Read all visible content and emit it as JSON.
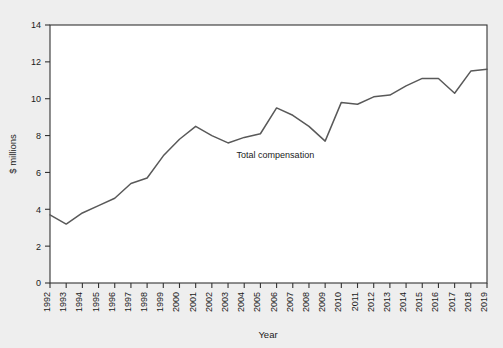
{
  "chart_data": {
    "type": "line",
    "title": "",
    "subtitle": "",
    "xlabel": "Year",
    "ylabel": "$ millions",
    "xlim": [
      1992,
      2019
    ],
    "ylim": [
      0,
      14
    ],
    "ytick_step": 2,
    "yticks": [
      "0",
      "2",
      "4",
      "6",
      "8",
      "10",
      "12",
      "14"
    ],
    "grid": false,
    "legend_position": "inline-annotation",
    "annotations": [
      {
        "text": "Total compensation",
        "x": 2006,
        "y": 6.8
      }
    ],
    "categories": [
      "1992",
      "1993",
      "1994",
      "1995",
      "1996",
      "1997",
      "1998",
      "1999",
      "2000",
      "2001",
      "2002",
      "2003",
      "2004",
      "2005",
      "2006",
      "2007",
      "2008",
      "2009",
      "2010",
      "2011",
      "2012",
      "2013",
      "2014",
      "2015",
      "2016",
      "2017",
      "2018",
      "2019"
    ],
    "series": [
      {
        "name": "Total compensation",
        "color": "#595959",
        "values": [
          3.7,
          3.2,
          3.8,
          4.2,
          4.6,
          5.4,
          5.7,
          6.9,
          7.8,
          8.5,
          8.0,
          7.6,
          7.9,
          8.1,
          9.5,
          9.1,
          8.5,
          7.7,
          9.8,
          9.7,
          10.1,
          10.2,
          10.7,
          11.1,
          11.1,
          10.3,
          11.5,
          11.6
        ]
      }
    ]
  },
  "figure": {
    "background_color": "#eeeeee",
    "plot_background_color": "#ffffff",
    "axis_color": "#333333",
    "line_color": "#595959"
  }
}
